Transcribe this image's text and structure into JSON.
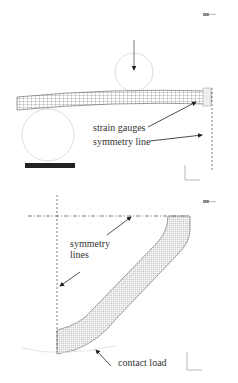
{
  "top_panel": {
    "labels": {
      "strain_gauges": "strain gauges",
      "symmetry_line": "symmetry line"
    },
    "icons": [
      "logo-icon",
      "load-arrow-icon",
      "loading-roller-icon",
      "support-roller-icon",
      "scale-bar-icon",
      "coordinate-axes-icon"
    ]
  },
  "bottom_panel": {
    "labels": {
      "symmetry_lines_1": "symmetry",
      "symmetry_lines_2": "lines",
      "contact_load": "contact load"
    },
    "icons": [
      "logo-icon",
      "coordinate-axes-icon"
    ]
  },
  "colors": {
    "mesh": "#555555",
    "arrow": "#222222",
    "roller": "#cccccc",
    "scale_bar": "#222222"
  }
}
